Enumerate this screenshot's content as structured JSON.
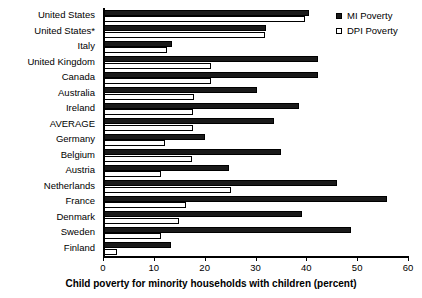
{
  "chart_data": {
    "type": "bar",
    "orientation": "horizontal",
    "title": "",
    "xlabel": "Child poverty for minority households with children (percent)",
    "ylabel": "",
    "xlim": [
      0,
      60
    ],
    "xticks": [
      0,
      10,
      20,
      30,
      40,
      50,
      60
    ],
    "xtick_labels": [
      "0",
      "10",
      "20",
      "30",
      "40",
      "50",
      "60"
    ],
    "grid": false,
    "legend_position": "top-right",
    "categories": [
      "United States",
      "United States*",
      "Italy",
      "United Kingdom",
      "Canada",
      "Australia",
      "Ireland",
      "AVERAGE",
      "Germany",
      "Belgium",
      "Austria",
      "Netherlands",
      "France",
      "Denmark",
      "Sweden",
      "Finland"
    ],
    "series": [
      {
        "name": "MI Poverty",
        "color": "#1a1a1a",
        "values": [
          40.5,
          32.1,
          13.6,
          42.3,
          42.3,
          30.3,
          38.6,
          33.7,
          20.1,
          35.0,
          24.8,
          46.1,
          55.9,
          39.2,
          48.8,
          13.4
        ]
      },
      {
        "name": "DPI Poverty",
        "color": "#ffffff",
        "values": [
          39.8,
          31.9,
          12.6,
          21.3,
          21.3,
          17.9,
          17.7,
          17.7,
          12.2,
          17.5,
          11.5,
          25.2,
          16.3,
          15.0,
          11.4,
          2.8
        ]
      }
    ]
  },
  "legend": {
    "items": [
      {
        "label": "MI Poverty",
        "swatch": "filled-square-icon"
      },
      {
        "label": "DPI Poverty",
        "swatch": "open-square-icon"
      }
    ]
  }
}
